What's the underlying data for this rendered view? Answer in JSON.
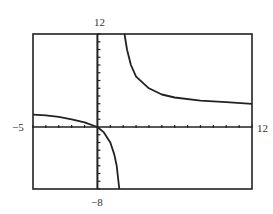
{
  "chart_data": {
    "type": "line",
    "title": "",
    "xlabel": "",
    "ylabel": "",
    "xlim": [
      -5,
      12
    ],
    "ylim": [
      -8,
      12
    ],
    "x_tick_step": 1,
    "y_tick_step": 1,
    "grid": false,
    "window_labels": {
      "ymax": "12",
      "xmin": "-5",
      "xmax": "12",
      "ymin": "-8"
    },
    "series": [
      {
        "name": "left branch",
        "points": [
          [
            -5,
            1.6
          ],
          [
            -4,
            1.5
          ],
          [
            -3,
            1.3
          ],
          [
            -2,
            1.0
          ],
          [
            -1,
            0.6
          ],
          [
            0,
            0
          ],
          [
            0.5,
            -0.7
          ],
          [
            1,
            -2
          ],
          [
            1.3,
            -3.5
          ],
          [
            1.5,
            -5
          ],
          [
            1.7,
            -8
          ]
        ]
      },
      {
        "name": "right branch",
        "points": [
          [
            2.1,
            12
          ],
          [
            2.3,
            10
          ],
          [
            2.6,
            8
          ],
          [
            3,
            6.5
          ],
          [
            4,
            5
          ],
          [
            5,
            4.2
          ],
          [
            6,
            3.8
          ],
          [
            8,
            3.4
          ],
          [
            10,
            3.2
          ],
          [
            12,
            3.0
          ]
        ]
      }
    ]
  }
}
